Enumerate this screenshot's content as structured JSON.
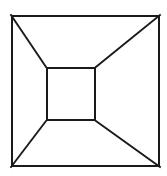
{
  "figure": {
    "name": "one-point-perspective-box",
    "title": "Perspective box illusion",
    "description": "Line drawing of a square within a square connected by four corner diagonals, forming a one-point perspective tunnel or truncated pyramid.",
    "canvas": {
      "width": 167,
      "height": 176,
      "background": "#ffffff"
    },
    "style": {
      "line_color": "#1a1a1a",
      "fill_color": "#ffffff",
      "outer_stroke_width": 2,
      "inner_stroke_width": 2,
      "diagonal_stroke_width": 1.9
    },
    "outer_square": {
      "label": "outer square",
      "left": 11,
      "top": 15,
      "right": 160,
      "bottom": 167,
      "width": 149,
      "height": 152,
      "corners": {
        "top_left": [
          11,
          15
        ],
        "top_right": [
          160,
          15
        ],
        "bottom_right": [
          160,
          167
        ],
        "bottom_left": [
          11,
          167
        ]
      }
    },
    "inner_square": {
      "label": "inner square",
      "left": 46,
      "top": 67,
      "right": 96,
      "bottom": 121,
      "width": 50,
      "height": 54,
      "corners": {
        "top_left": [
          46,
          67
        ],
        "top_right": [
          96,
          67
        ],
        "bottom_right": [
          96,
          121
        ],
        "bottom_left": [
          46,
          121
        ]
      }
    },
    "diagonals": [
      {
        "label": "top-left diagonal",
        "from": [
          11,
          15
        ],
        "to": [
          46,
          67
        ]
      },
      {
        "label": "top-right diagonal",
        "from": [
          160,
          15
        ],
        "to": [
          96,
          67
        ]
      },
      {
        "label": "bottom-right diagonal",
        "from": [
          160,
          167
        ],
        "to": [
          96,
          121
        ]
      },
      {
        "label": "bottom-left diagonal",
        "from": [
          11,
          167
        ],
        "to": [
          46,
          121
        ]
      }
    ],
    "faces": [
      {
        "label": "top trapezoid",
        "points": "11,15 160,15 96,67 46,67"
      },
      {
        "label": "right trapezoid",
        "points": "160,15 160,167 96,121 96,67"
      },
      {
        "label": "bottom trapezoid",
        "points": "160,167 11,167 46,121 96,121"
      },
      {
        "label": "left trapezoid",
        "points": "11,15 46,67 46,121 11,167"
      }
    ]
  }
}
